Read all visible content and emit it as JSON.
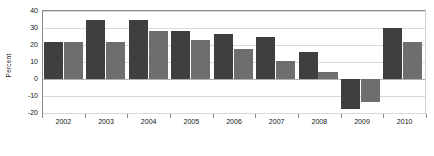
{
  "chart_data": {
    "type": "bar",
    "title": "",
    "subtitle": "",
    "xlabel": "",
    "ylabel": "Percent",
    "categories": [
      "2002",
      "2003",
      "2004",
      "2005",
      "2006",
      "2007",
      "2008",
      "2009",
      "2010"
    ],
    "series": [
      {
        "name": "series-1",
        "color": "#3f3f3f",
        "values": [
          22,
          34.5,
          35,
          28,
          26.5,
          25,
          16,
          -17.5,
          30
        ]
      },
      {
        "name": "series-2",
        "color": "#6e6e6e",
        "values": [
          22,
          21.5,
          28.5,
          23,
          17.5,
          10.5,
          4,
          -13.5,
          22
        ]
      }
    ],
    "ylim": [
      -20,
      40
    ],
    "yticks": [
      40,
      30,
      20,
      10,
      0,
      -10,
      -20
    ],
    "ytick_labels": [
      "40",
      "30",
      "20",
      "10",
      "0",
      "-10",
      "-20"
    ],
    "grid": true,
    "grid_axis": "y",
    "legend": false,
    "legend_position": "none",
    "annotations": []
  },
  "axes": {
    "y_title": "Percent"
  }
}
